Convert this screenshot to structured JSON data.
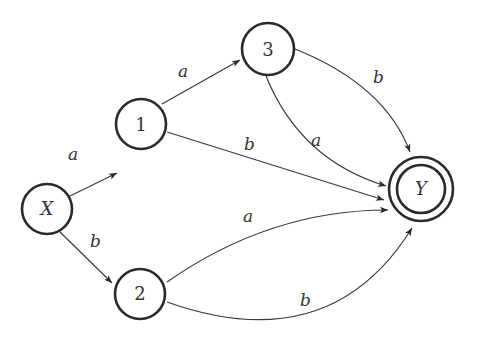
{
  "diagram": {
    "type": "finite-automaton",
    "nodes": [
      {
        "id": "X",
        "label": "X",
        "accepting": false
      },
      {
        "id": "1",
        "label": "1",
        "accepting": false
      },
      {
        "id": "2",
        "label": "2",
        "accepting": false
      },
      {
        "id": "3",
        "label": "3",
        "accepting": false
      },
      {
        "id": "Y",
        "label": "Y",
        "accepting": true
      }
    ],
    "edges": [
      {
        "from": "X",
        "to": "1",
        "label": "a"
      },
      {
        "from": "X",
        "to": "2",
        "label": "b"
      },
      {
        "from": "1",
        "to": "3",
        "label": "a"
      },
      {
        "from": "1",
        "to": "Y",
        "label": "b"
      },
      {
        "from": "3",
        "to": "Y",
        "label": "a"
      },
      {
        "from": "3",
        "to": "Y",
        "label": "b"
      },
      {
        "from": "2",
        "to": "Y",
        "label": "a"
      },
      {
        "from": "2",
        "to": "Y",
        "label": "b"
      }
    ]
  }
}
